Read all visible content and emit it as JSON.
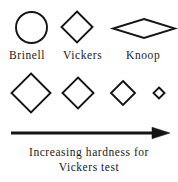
{
  "figure": {
    "background_color": "#ffffff",
    "stroke_color": "#151515",
    "indenter_row": {
      "shapes": [
        {
          "name": "brinell-circle",
          "icon": "circle-icon",
          "label": "Brinell",
          "geometry": {
            "cx": 31.5,
            "cy": 27.5,
            "r": 15.5
          },
          "stroke_width": 1.9
        },
        {
          "name": "vickers-diamond",
          "icon": "diamond-icon",
          "label": "Vickers",
          "geometry": {
            "cx": 77,
            "cy": 27,
            "half_width": 15.5,
            "half_height": 15.5
          },
          "stroke_width": 1.9
        },
        {
          "name": "knoop-rhombus",
          "icon": "elongated-rhombus-icon",
          "label": "Knoop",
          "geometry": {
            "cx": 144,
            "cy": 28.5,
            "half_width": 31,
            "half_height": 9.5
          },
          "stroke_width": 1.9
        }
      ]
    },
    "scale_row": {
      "name": "vickers-indent-size-series",
      "indents": [
        {
          "name": "indent-largest",
          "icon": "diamond-icon",
          "cx": 31,
          "cy": 93,
          "half_size": 19.5,
          "stroke_width": 1.9
        },
        {
          "name": "indent-large",
          "icon": "diamond-icon",
          "cx": 78,
          "cy": 93,
          "half_size": 15.5,
          "stroke_width": 1.9
        },
        {
          "name": "indent-small",
          "icon": "diamond-icon",
          "cx": 123,
          "cy": 93,
          "half_size": 12.0,
          "stroke_width": 1.9
        },
        {
          "name": "indent-smallest",
          "icon": "diamond-icon",
          "cx": 159,
          "cy": 93,
          "half_size": 5.5,
          "stroke_width": 1.9
        }
      ]
    },
    "arrow": {
      "name": "increasing-hardness-arrow",
      "icon": "arrow-right-icon",
      "direction": "right",
      "x_start": 11,
      "x_end": 170,
      "y": 133,
      "shaft_thickness": 3.0,
      "head_length": 16,
      "head_half_height": 6
    },
    "caption": {
      "line1": "Increasing hardness for",
      "line2": "Vickers test"
    }
  }
}
